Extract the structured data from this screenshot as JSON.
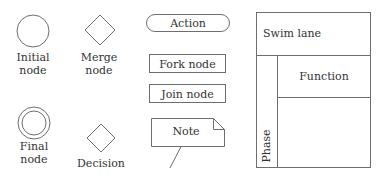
{
  "diagram": {
    "colors": {
      "stroke": "#6e6e6e",
      "text": "#333333",
      "background": "#ffffff"
    },
    "symbols": {
      "initial_node": {
        "label_line1": "Initial",
        "label_line2": "node",
        "shape": "circle"
      },
      "merge_node": {
        "label_line1": "Merge",
        "label_line2": "node",
        "shape": "diamond"
      },
      "final_node": {
        "label_line1": "Final",
        "label_line2": "node",
        "shape": "double-circle"
      },
      "decision": {
        "label": "Decision",
        "shape": "diamond"
      },
      "action": {
        "label": "Action",
        "shape": "rounded-rectangle"
      },
      "fork_node": {
        "label": "Fork node",
        "shape": "rectangle"
      },
      "join_node": {
        "label": "Join node",
        "shape": "rectangle"
      },
      "note": {
        "label": "Note",
        "shape": "folded-note"
      }
    },
    "swimlane": {
      "title": "Swim lane",
      "function_label": "Function",
      "phase_label": "Phase"
    }
  }
}
